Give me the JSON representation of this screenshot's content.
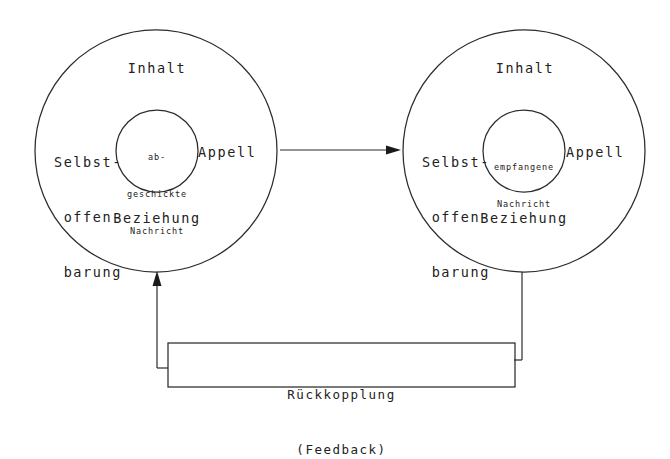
{
  "diagram": {
    "title_semantic": "vier-seiten-einer-nachricht-kommunikationsmodell",
    "sender": {
      "id": "sender-circle",
      "top_label": "Inhalt",
      "left_label_lines": [
        "Selbst-",
        "offen-",
        "barung"
      ],
      "right_label": "Appell",
      "bottom_label": "Beziehung",
      "inner_label_lines": [
        "ab-",
        "geschickte",
        "Nachricht"
      ]
    },
    "receiver": {
      "id": "receiver-circle",
      "top_label": "Inhalt",
      "left_label_lines": [
        "Selbst-",
        "offen-",
        "barung"
      ],
      "right_label": "Appell",
      "bottom_label": "Beziehung",
      "inner_label_lines": [
        "empfangene",
        "Nachricht"
      ]
    },
    "transmission_arrow": {
      "id": "sender-to-receiver-arrow",
      "direction": "right"
    },
    "feedback_box": {
      "id": "feedback-box",
      "line1": "Rückkopplung",
      "line2": "(Feedback)"
    },
    "feedback_arrow": {
      "id": "feedback-return-arrow",
      "direction": "up"
    },
    "colors": {
      "ink": "#1a1a1a",
      "stroke": "#2b2b2b",
      "background": "#ffffff"
    }
  }
}
